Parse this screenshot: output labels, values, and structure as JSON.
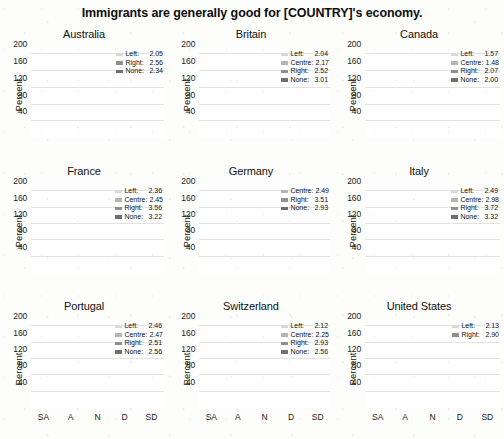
{
  "figure": {
    "title": "Immigrants are generally good for [COUNTRY]'s economy.",
    "ylabel": "Percent",
    "yticks": [
      "40",
      "80",
      "120",
      "160",
      "200"
    ],
    "ytick_values": [
      40,
      80,
      120,
      160,
      200
    ],
    "ylim": [
      0,
      215
    ],
    "xcategories": [
      "SA",
      "A",
      "N",
      "D",
      "SD"
    ],
    "colors": {
      "Left": "#d9d9d9",
      "Centre": "#b5b5b5",
      "Right": "#8f8f8f",
      "None": "#6f6f6f"
    }
  },
  "chart_data": {
    "type": "bar",
    "title": "Immigrants are generally good for [COUNTRY]'s economy.",
    "subtitle": "",
    "xlabel": "",
    "ylabel": "Percent",
    "ylim": [
      0,
      215
    ],
    "yticks": [
      40,
      80,
      120,
      160,
      200
    ],
    "grid": true,
    "stacked": true,
    "legend_position": "top-right inside each panel",
    "categories": [
      "SA",
      "A",
      "N",
      "D",
      "SD"
    ],
    "panels": [
      {
        "name": "Australia",
        "legend": [
          {
            "name": "Left",
            "value": "2.05"
          },
          {
            "name": "Right",
            "value": "2.56"
          },
          {
            "name": "None",
            "value": "2.34"
          }
        ],
        "series": [
          {
            "name": "None",
            "values": [
              36,
              87,
              39,
              25,
              18
            ]
          },
          {
            "name": "Right",
            "values": [
              12,
              22,
              8,
              5,
              2
            ]
          },
          {
            "name": "Left",
            "values": [
              19,
              22,
              5,
              3,
              1
            ]
          }
        ],
        "totals": [
          67,
          131,
          52,
          33,
          21
        ]
      },
      {
        "name": "Britain",
        "legend": [
          {
            "name": "Left",
            "value": "2.04"
          },
          {
            "name": "Centre",
            "value": "2.17"
          },
          {
            "name": "Right",
            "value": "2.52"
          },
          {
            "name": "None",
            "value": "3.01"
          }
        ],
        "series": [
          {
            "name": "None",
            "values": [
              25,
              74,
              49,
              38,
              23
            ]
          },
          {
            "name": "Right",
            "values": [
              18,
              42,
              13,
              10,
              3
            ]
          },
          {
            "name": "Centre",
            "values": [
              20,
              26,
              10,
              5,
              1
            ]
          },
          {
            "name": "Left",
            "values": [
              20,
              17,
              7,
              2,
              1
            ]
          }
        ],
        "totals": [
          83,
          159,
          79,
          55,
          28
        ]
      },
      {
        "name": "Canada",
        "legend": [
          {
            "name": "Left",
            "value": "1.57"
          },
          {
            "name": "Centre",
            "value": "1.48"
          },
          {
            "name": "Right",
            "value": "2.07"
          },
          {
            "name": "None",
            "value": "2.00"
          }
        ],
        "series": [
          {
            "name": "None",
            "values": [
              57,
              89,
              20,
              19,
              8
            ]
          },
          {
            "name": "Right",
            "values": [
              62,
              33,
              3,
              2,
              1
            ]
          },
          {
            "name": "Centre",
            "values": [
              30,
              18,
              1,
              1,
              0
            ]
          },
          {
            "name": "Left",
            "values": [
              36,
              15,
              1,
              1,
              0
            ]
          }
        ],
        "totals": [
          185,
          155,
          25,
          23,
          9
        ]
      },
      {
        "name": "France",
        "legend": [
          {
            "name": "Left",
            "value": "2.36"
          },
          {
            "name": "Centre",
            "value": "2.45"
          },
          {
            "name": "Right",
            "value": "3.56"
          },
          {
            "name": "None",
            "value": "3.22"
          }
        ],
        "series": [
          {
            "name": "None",
            "values": [
              16,
              38,
              36,
              33,
              30
            ]
          },
          {
            "name": "Right",
            "values": [
              10,
              28,
              20,
              19,
              13
            ]
          },
          {
            "name": "Centre",
            "values": [
              8,
              25,
              20,
              12,
              8
            ]
          },
          {
            "name": "Left",
            "values": [
              13,
              44,
              14,
              7,
              5
            ]
          }
        ],
        "totals": [
          47,
          135,
          90,
          71,
          56
        ]
      },
      {
        "name": "Germany",
        "legend": [
          {
            "name": "Centre",
            "value": "2.49"
          },
          {
            "name": "Right",
            "value": "3.51"
          },
          {
            "name": "None",
            "value": "2.93"
          }
        ],
        "series": [
          {
            "name": "None",
            "values": [
              17,
              36,
              84,
              35,
              27
            ]
          },
          {
            "name": "Right",
            "values": [
              7,
              18,
              23,
              5,
              3
            ]
          },
          {
            "name": "Centre",
            "values": [
              5,
              12,
              20,
              3,
              2
            ]
          }
        ],
        "totals": [
          29,
          66,
          127,
          43,
          32
        ]
      },
      {
        "name": "Italy",
        "legend": [
          {
            "name": "Left",
            "value": "2.49"
          },
          {
            "name": "Centre",
            "value": "2.98"
          },
          {
            "name": "Right",
            "value": "3.72"
          },
          {
            "name": "None",
            "value": "3.32"
          }
        ],
        "series": [
          {
            "name": "None",
            "values": [
              20,
              41,
              34,
              35,
              44
            ]
          },
          {
            "name": "Right",
            "values": [
              12,
              19,
              18,
              17,
              19
            ]
          },
          {
            "name": "Centre",
            "values": [
              10,
              20,
              13,
              14,
              16
            ]
          },
          {
            "name": "Left",
            "values": [
              10,
              26,
              9,
              10,
              13
            ]
          }
        ],
        "totals": [
          52,
          106,
          74,
          76,
          92
        ]
      },
      {
        "name": "Portugal",
        "legend": [
          {
            "name": "Left",
            "value": "2.46"
          },
          {
            "name": "Centre",
            "value": "2.47"
          },
          {
            "name": "Right",
            "value": "2.51"
          },
          {
            "name": "None",
            "value": "2.56"
          }
        ],
        "series": [
          {
            "name": "None",
            "values": [
              9,
              48,
              46,
              29,
              4
            ]
          },
          {
            "name": "Right",
            "values": [
              4,
              62,
              23,
              11,
              1
            ]
          },
          {
            "name": "Centre",
            "values": [
              3,
              48,
              12,
              8,
              1
            ]
          },
          {
            "name": "Left",
            "values": [
              3,
              54,
              8,
              6,
              1
            ]
          }
        ],
        "totals": [
          19,
          212,
          89,
          54,
          7
        ]
      },
      {
        "name": "Switzerland",
        "legend": [
          {
            "name": "Left",
            "value": "2.12"
          },
          {
            "name": "Centre",
            "value": "2.25"
          },
          {
            "name": "Right",
            "value": "2.93"
          },
          {
            "name": "None",
            "value": "2.56"
          }
        ],
        "series": [
          {
            "name": "None",
            "values": [
              16,
              36,
              20,
              16,
              12
            ]
          },
          {
            "name": "Right",
            "values": [
              14,
              44,
              35,
              21,
              6
            ]
          },
          {
            "name": "Centre",
            "values": [
              12,
              56,
              17,
              10,
              2
            ]
          },
          {
            "name": "Left",
            "values": [
              12,
              53,
              13,
              6,
              1
            ]
          }
        ],
        "totals": [
          54,
          189,
          85,
          53,
          21
        ]
      },
      {
        "name": "United States",
        "legend": [
          {
            "name": "Left",
            "value": "2.13"
          },
          {
            "name": "Right",
            "value": "2.90"
          }
        ],
        "series": [
          {
            "name": "Right",
            "values": [
              18,
              35,
              29,
              22,
              15
            ]
          },
          {
            "name": "Left",
            "values": [
              17,
              40,
              17,
              8,
              4
            ]
          }
        ],
        "totals": [
          35,
          75,
          46,
          30,
          19
        ]
      }
    ]
  }
}
